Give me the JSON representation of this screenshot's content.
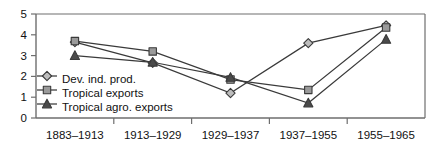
{
  "chart_data": {
    "type": "line",
    "title": "",
    "subtitle": "",
    "xlabel": "",
    "ylabel": "",
    "categories": [
      "1883–1913",
      "1913–1929",
      "1929–1937",
      "1937–1955",
      "1955–1965"
    ],
    "ylim": [
      0,
      5
    ],
    "yticks": [
      0,
      1,
      2,
      3,
      4,
      5
    ],
    "ytick_labels": [
      "0",
      "1",
      "2",
      "3",
      "4",
      "5"
    ],
    "grid": false,
    "legend_position": "inside-left",
    "series": [
      {
        "name": "Dev. ind. prod.",
        "marker": "diamond",
        "color": "#3a3a3a",
        "marker_fill": "#bdbdbd",
        "values": [
          3.65,
          2.65,
          1.2,
          3.6,
          4.45
        ]
      },
      {
        "name": "Tropical exports",
        "marker": "square",
        "color": "#3a3a3a",
        "marker_fill": "#9a9a9a",
        "values": [
          3.7,
          3.2,
          1.85,
          1.35,
          4.35
        ]
      },
      {
        "name": "Tropical agro. exports",
        "marker": "triangle",
        "color": "#3a3a3a",
        "marker_fill": "#4a4a4a",
        "values": [
          3.0,
          2.68,
          1.95,
          0.72,
          3.78
        ]
      }
    ]
  },
  "legend": {
    "items": [
      {
        "label": "Dev. ind. prod.",
        "marker": "diamond"
      },
      {
        "label": "Tropical exports",
        "marker": "square"
      },
      {
        "label": "Tropical agro. exports",
        "marker": "triangle"
      }
    ]
  },
  "axes": {
    "y_axis_name": "y-axis",
    "x_axis_name": "x-axis"
  },
  "colors": {
    "axis": "#6e6e6e",
    "line": "#3a3a3a",
    "text": "#111111",
    "background": "#ffffff"
  }
}
